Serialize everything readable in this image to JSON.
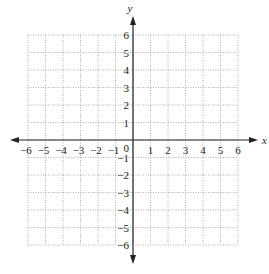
{
  "chart_data": {
    "type": "scatter",
    "title": "",
    "xlabel": "x",
    "ylabel": "y",
    "xlim": [
      -6,
      6
    ],
    "ylim": [
      -6,
      6
    ],
    "grid": true,
    "grid_style": "dotted",
    "x_ticks": [
      "-6",
      "-5",
      "-4",
      "-3",
      "-2",
      "-1",
      "1",
      "2",
      "3",
      "4",
      "5",
      "6"
    ],
    "y_ticks": [
      "6",
      "5",
      "4",
      "3",
      "2",
      "1",
      "-1",
      "-2",
      "-3",
      "-4",
      "-5",
      "-6"
    ],
    "origin_label": "0",
    "series": [],
    "legend": null
  },
  "colors": {
    "axis": "#222222",
    "grid": "#9a9a9a",
    "background": "#ffffff"
  }
}
